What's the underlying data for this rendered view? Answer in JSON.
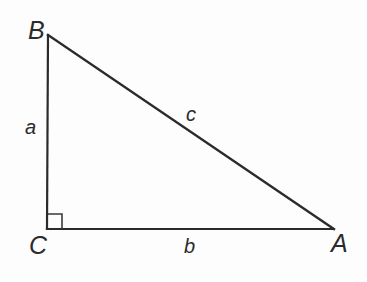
{
  "figure": {
    "kind": "right-triangle-diagram",
    "background_color": "#fdfdfd",
    "stroke_color": "#2b2b2b",
    "width": 367,
    "height": 282,
    "vertices": [
      {
        "label": "B",
        "x": 48,
        "y": 35,
        "angle_marker": false
      },
      {
        "label": "C",
        "x": 47,
        "y": 229,
        "angle_marker": true
      },
      {
        "label": "A",
        "x": 333,
        "y": 229,
        "angle_marker": false
      }
    ],
    "sides": [
      {
        "label": "a",
        "from": "B",
        "to": "C",
        "role": "vertical-leg"
      },
      {
        "label": "b",
        "from": "C",
        "to": "A",
        "role": "horizontal-leg"
      },
      {
        "label": "c",
        "from": "B",
        "to": "A",
        "role": "hypotenuse"
      }
    ],
    "right_angle": {
      "at_vertex": "C",
      "marker_shape": "square",
      "marker_size": 14
    },
    "labels": {
      "vertex_B": "B",
      "vertex_C": "C",
      "vertex_A": "A",
      "side_a": "a",
      "side_b": "b",
      "side_c": "c"
    }
  }
}
